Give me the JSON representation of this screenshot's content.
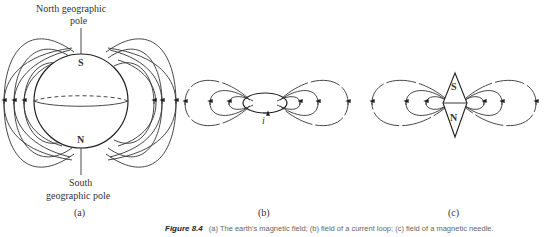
{
  "panel_a": {
    "north_label": "North geographic",
    "north_label2": "pole",
    "south_label": "South",
    "south_label2": "geographic pole",
    "pole_top": "S",
    "pole_bottom": "N",
    "sublabel": "(a)"
  },
  "panel_b": {
    "current_label": "i",
    "sublabel": "(b)"
  },
  "panel_c": {
    "pole_top": "S",
    "pole_bottom": "N",
    "sublabel": "(c)"
  },
  "caption": {
    "figure_label": "Figure 8.4",
    "text": "(a) The earth's magnetic field; (b) field of a current loop; (c) field of a magnetic needle."
  }
}
